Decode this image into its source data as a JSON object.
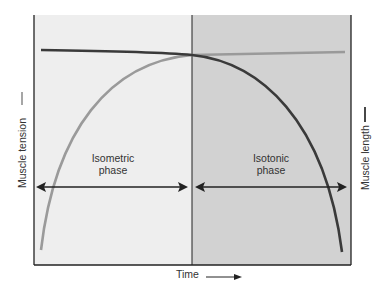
{
  "diagram": {
    "y_axis_left_label": "Muscle tension",
    "y_axis_right_label": "Muscle length",
    "x_axis_label": "Time",
    "phases": [
      {
        "name": "isometric",
        "label_line1": "Isometric",
        "label_line2": "phase",
        "background": "#eeeeee"
      },
      {
        "name": "isotonic",
        "label_line1": "Isotonic",
        "label_line2": "phase",
        "background": "#d2d2d2"
      }
    ],
    "curves": [
      {
        "name": "muscle-tension",
        "color": "#9a9a9a",
        "description": "rises steeply during isometric phase, plateaus during isotonic phase"
      },
      {
        "name": "muscle-length",
        "color": "#3a3a3a",
        "description": "constant during isometric phase, drops steeply during isotonic phase"
      }
    ],
    "colors": {
      "frame": "#222222",
      "isometric_bg": "#eeeeee",
      "isotonic_bg": "#d2d2d2",
      "tension_curve": "#9a9a9a",
      "length_curve": "#3a3a3a"
    }
  }
}
